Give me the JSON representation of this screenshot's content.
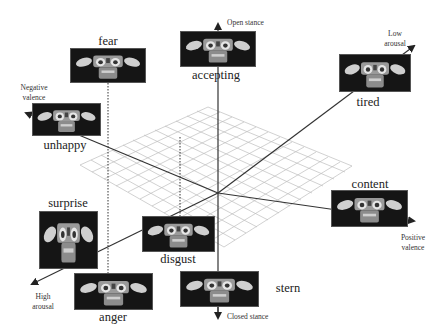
{
  "diagram": {
    "type": "3d-emotion-space",
    "axes": {
      "stance_up": "Open stance",
      "stance_down": "Closed stance",
      "arousal_low": "Low arousal",
      "arousal_high": "High arousal",
      "valence_negative": "Negative valence",
      "valence_positive": "Positive valence"
    },
    "axis_labels_lines": {
      "low_arousal": [
        "Low",
        "arousal"
      ],
      "high_arousal": [
        "High",
        "arousal"
      ],
      "negative_valence": [
        "Negative",
        "valence"
      ],
      "positive_valence": [
        "Positive",
        "valence"
      ]
    },
    "emotions": [
      {
        "label": "fear"
      },
      {
        "label": "accepting"
      },
      {
        "label": "tired"
      },
      {
        "label": "unhappy"
      },
      {
        "label": "content"
      },
      {
        "label": "surprise"
      },
      {
        "label": "disgust"
      },
      {
        "label": "anger"
      },
      {
        "label": "stern"
      }
    ],
    "colors": {
      "axis": "#333333",
      "grid": "#bbbbbb",
      "image_bg": "#1a1a1a",
      "text": "#222222"
    }
  }
}
